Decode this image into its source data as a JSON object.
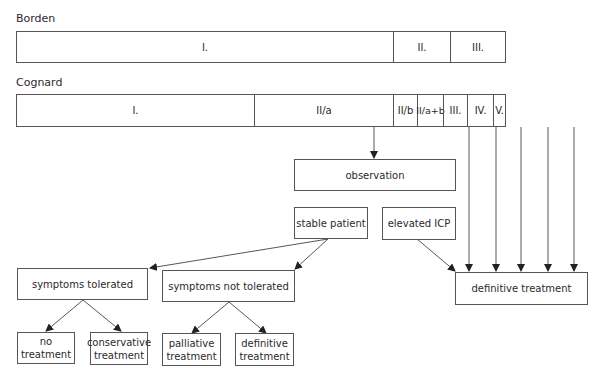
{
  "borden": {
    "title": "Borden",
    "segments": [
      "I.",
      "II.",
      "III."
    ]
  },
  "cognard": {
    "title": "Cognard",
    "segments": [
      "I.",
      "II/a",
      "II/b",
      "II/a+b",
      "III.",
      "IV.",
      "V."
    ]
  },
  "nodes": {
    "observation": "observation",
    "stable_patient": "stable patient",
    "elevated_icp": "elevated ICP",
    "definitive_treatment_main": "definitive treatment",
    "symptoms_tolerated": "symptoms tolerated",
    "symptoms_not_tolerated": "symptoms not tolerated",
    "no_treatment": "no treatment",
    "conservative_treatment": "conservative treatment",
    "palliative_treatment": "palliative treatment",
    "definitive_treatment": "definitive treatment"
  },
  "colors": {
    "line": "#555555",
    "text": "#2a2a2a"
  }
}
